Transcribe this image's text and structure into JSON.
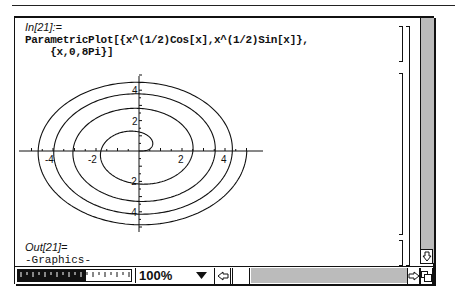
{
  "notebook": {
    "input_label": "In[21]:=",
    "input_code_line1": "ParametricPlot[{x^(1/2)Cos[x],x^(1/2)Sin[x]},",
    "input_code_line2": "    {x,0,8Pi}]",
    "output_label": "Out[21]=",
    "output_value": "-Graphics-"
  },
  "status_bar": {
    "zoom_level": "100%",
    "zoom_dropdown_icon": "triangle-down-icon",
    "scroll_left_icon": "arrow-left-icon",
    "scroll_right_icon": "arrow-right-icon",
    "scroll_down_icon": "arrow-down-icon",
    "resize_icon": "resize-icon",
    "magnification_meter_fill_pct": 60
  },
  "chart_data": {
    "type": "line",
    "title": "",
    "function": "ParametricPlot[{Sqrt[x] Cos[x], Sqrt[x] Sin[x]}, {x, 0, 8 Pi}]",
    "parameter_range": [
      0,
      25.1327
    ],
    "x_ticks": [
      -4,
      -2,
      2,
      4
    ],
    "y_ticks": [
      -4,
      -2,
      2,
      4
    ],
    "x_tick_labels": [
      "-4",
      "-2",
      "2",
      "4"
    ],
    "y_tick_labels": [
      "-4",
      "-2",
      "2",
      "4"
    ],
    "xlim": [
      -5.0,
      5.0
    ],
    "ylim": [
      -5.0,
      5.0
    ],
    "xlabel": "",
    "ylabel": "",
    "grid": false,
    "legend": null,
    "series": [
      {
        "name": "spiral",
        "description": "Fermat spiral r = sqrt(t), 4 turns, starting at origin, ending at (5.01, 0)"
      }
    ]
  }
}
